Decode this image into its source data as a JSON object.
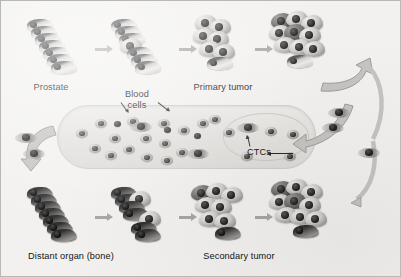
{
  "figure": {
    "background_color": "#f2f1ef",
    "border_color": "#b9b8b6"
  },
  "labels": {
    "prostate": "Prostate",
    "primary_tumor": "Primary tumor",
    "blood_cells_line1": "Blood",
    "blood_cells_line2": "cells",
    "ctcs": "CTCs",
    "distant_organ": "Distant organ (bone)",
    "secondary_tumor": "Secondary tumor"
  },
  "stages": {
    "top_row": [
      {
        "name": "normal-prostate-epithelium",
        "cells": 7,
        "type": "epithelial"
      },
      {
        "name": "prostate-with-transformed-cell",
        "cells": 7,
        "type": "epithelial-plus-tumor"
      },
      {
        "name": "early-primary-tumor",
        "cells": 7,
        "type": "tumor"
      },
      {
        "name": "primary-tumor",
        "cells": 10,
        "type": "tumor"
      }
    ],
    "bottom_row": [
      {
        "name": "distant-organ-bone",
        "cells": 7,
        "type": "bone"
      },
      {
        "name": "bone-with-tumor-cells",
        "cells": 7,
        "type": "bone-plus-tumor"
      },
      {
        "name": "early-secondary-tumor",
        "cells": 8,
        "type": "tumor"
      },
      {
        "name": "secondary-tumor",
        "cells": 10,
        "type": "tumor"
      }
    ]
  },
  "vessel": {
    "name": "blood-vessel",
    "blood_cell_count": 24,
    "ctc_count": 3
  },
  "colors": {
    "vessel_fill": "#e8e6e3",
    "vessel_stroke": "#cfcdc9",
    "arrow_gray": "#a8a6a2",
    "curved_arrow_fill": "#c6c4c0",
    "curved_arrow_stroke": "#9e9c98",
    "nucleus_dark": "#1e1e1e",
    "text": "#141414"
  },
  "flow_arrows": {
    "straight_count": 6,
    "curved": [
      {
        "name": "intravasation-arrow-right-up",
        "direction": "up-right"
      },
      {
        "name": "intravasation-arrow-into-vessel",
        "direction": "left-down"
      },
      {
        "name": "circulation-arrow-right-down",
        "direction": "down"
      },
      {
        "name": "extravasation-arrow-left",
        "direction": "down-left"
      }
    ]
  }
}
